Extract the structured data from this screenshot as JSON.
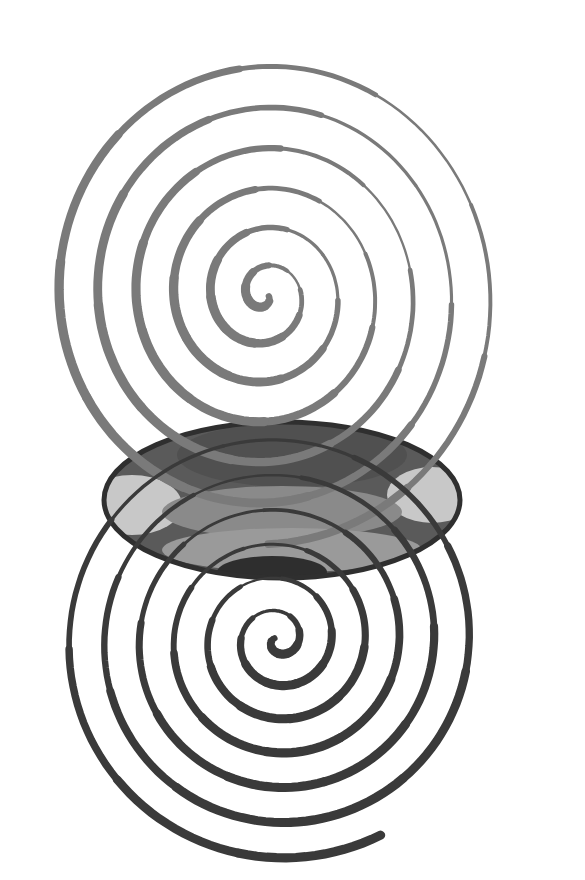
{
  "artwork": {
    "kind": "pencil drawing of two overlapping spirals",
    "background": "#ffffff",
    "upper_spiral": {
      "center": [
        265,
        295
      ],
      "stroke_color": "#7a7a7a",
      "turns": 6.2,
      "max_radius": 235,
      "tone": "light grey graphite"
    },
    "lower_spiral": {
      "center": [
        278,
        640
      ],
      "stroke_color": "#3a3a3a",
      "turns": 6.4,
      "max_radius": 225,
      "tone": "dark graphite"
    },
    "overlap_lens": {
      "center": [
        282,
        500
      ],
      "rx": 178,
      "ry": 78,
      "band_colors": [
        "#5a5a5a",
        "#8a8a8a",
        "#c8c8c8",
        "#6e6e6e",
        "#9a9a9a",
        "#2e2e2e"
      ]
    }
  }
}
